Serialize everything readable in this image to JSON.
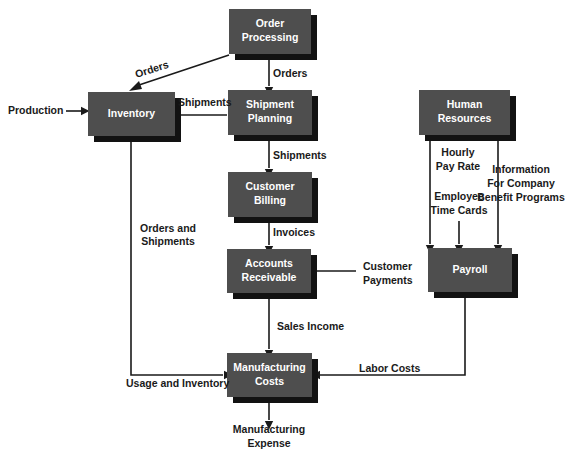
{
  "diagram": {
    "type": "flowchart",
    "background_color": "#ffffff",
    "node_fill_color": "#4e4e4e",
    "node_shadow_color": "#121212",
    "node_text_color": "#ffffff",
    "edge_color": "#1a1a1a",
    "nodes": [
      {
        "id": "order_processing",
        "line1": "Order",
        "line2": "Processing",
        "x": 229,
        "y": 9,
        "w": 82,
        "h": 45
      },
      {
        "id": "inventory",
        "line1": "Inventory",
        "line2": "",
        "x": 88,
        "y": 92,
        "w": 87,
        "h": 44
      },
      {
        "id": "shipment_planning",
        "line1": "Shipment",
        "line2": "Planning",
        "x": 228,
        "y": 90,
        "w": 84,
        "h": 45
      },
      {
        "id": "human_resources",
        "line1": "Human",
        "line2": "Resources",
        "x": 419,
        "y": 90,
        "w": 91,
        "h": 45
      },
      {
        "id": "customer_billing",
        "line1": "Customer",
        "line2": "Billing",
        "x": 228,
        "y": 172,
        "w": 84,
        "h": 45
      },
      {
        "id": "accounts_receivable",
        "line1": "Accounts",
        "line2": "Receivable",
        "x": 227,
        "y": 249,
        "w": 84,
        "h": 44
      },
      {
        "id": "payroll",
        "line1": "Payroll",
        "line2": "",
        "x": 428,
        "y": 248,
        "w": 84,
        "h": 44
      },
      {
        "id": "manufacturing_costs",
        "line1": "Manufacturing",
        "line2": "Costs",
        "x": 227,
        "y": 353,
        "w": 85,
        "h": 44
      }
    ],
    "edge_labels": [
      {
        "id": "orders_diagonal",
        "text": "Orders",
        "x": 152,
        "y": 70,
        "anchor": "mid",
        "rotate": -18
      },
      {
        "id": "orders_vertical",
        "text": "Orders",
        "x": 273,
        "y": 74,
        "anchor": "start"
      },
      {
        "id": "production",
        "text": "Production",
        "x": 8,
        "y": 111,
        "anchor": "start"
      },
      {
        "id": "shipments_to_inv",
        "text": "Shipments",
        "x": 178,
        "y": 103,
        "anchor": "start"
      },
      {
        "id": "shipments_down",
        "text": "Shipments",
        "x": 273,
        "y": 156,
        "anchor": "start"
      },
      {
        "id": "invoices",
        "text": "Invoices",
        "x": 273,
        "y": 233,
        "anchor": "start"
      },
      {
        "id": "orders_and_shipments_1",
        "text": "Orders and",
        "x": 168,
        "y": 229,
        "anchor": "mid"
      },
      {
        "id": "orders_and_shipments_2",
        "text": "Shipments",
        "x": 168,
        "y": 242,
        "anchor": "mid"
      },
      {
        "id": "customer_payments_1",
        "text": "Customer",
        "x": 363,
        "y": 267,
        "anchor": "start"
      },
      {
        "id": "customer_payments_2",
        "text": "Payments",
        "x": 363,
        "y": 281,
        "anchor": "start"
      },
      {
        "id": "hourly_pay_rate_1",
        "text": "Hourly",
        "x": 458,
        "y": 153,
        "anchor": "mid"
      },
      {
        "id": "hourly_pay_rate_2",
        "text": "Pay Rate",
        "x": 458,
        "y": 167,
        "anchor": "mid"
      },
      {
        "id": "employee_time_cards_1",
        "text": "Employee",
        "x": 459,
        "y": 197,
        "anchor": "mid"
      },
      {
        "id": "employee_time_cards_2",
        "text": "Time Cards",
        "x": 459,
        "y": 211,
        "anchor": "mid"
      },
      {
        "id": "info_benefit_1",
        "text": "Information",
        "x": 521,
        "y": 170,
        "anchor": "mid"
      },
      {
        "id": "info_benefit_2",
        "text": "For Company",
        "x": 521,
        "y": 184,
        "anchor": "mid"
      },
      {
        "id": "info_benefit_3",
        "text": "Benefit Programs",
        "x": 521,
        "y": 198,
        "anchor": "mid"
      },
      {
        "id": "sales_income",
        "text": "Sales Income",
        "x": 277,
        "y": 327,
        "anchor": "start"
      },
      {
        "id": "usage_and_inventory",
        "text": "Usage and Inventory",
        "x": 126,
        "y": 384,
        "anchor": "start"
      },
      {
        "id": "labor_costs",
        "text": "Labor Costs",
        "x": 359,
        "y": 369,
        "anchor": "start"
      },
      {
        "id": "manufacturing_expense_1",
        "text": "Manufacturing",
        "x": 269,
        "y": 430,
        "anchor": "mid"
      },
      {
        "id": "manufacturing_expense_2",
        "text": "Expense",
        "x": 269,
        "y": 444,
        "anchor": "mid"
      }
    ],
    "connectors": [
      {
        "id": "order-processing-to-inventory-diagonal",
        "d": "M 229 55 L 136 86"
      },
      {
        "id": "order-processing-to-shipment-planning",
        "d": "M 269 54 L 269 86"
      },
      {
        "id": "production-to-inventory",
        "d": "M 66 111 L 84 111"
      },
      {
        "id": "shipment-planning-to-inventory",
        "d": "M 227 115 L 180 115"
      },
      {
        "id": "shipment-planning-to-customer-billing",
        "d": "M 269 135 L 269 168"
      },
      {
        "id": "customer-billing-to-accounts-receivable",
        "d": "M 269 217 L 269 245"
      },
      {
        "id": "customer-payments-to-accounts-receivable",
        "d": "M 356 271 L 317 271"
      },
      {
        "id": "human-resources-to-payroll-left",
        "d": "M 430 135 L 430 244"
      },
      {
        "id": "employee-time-cards-to-payroll",
        "d": "M 459 221 L 459 244"
      },
      {
        "id": "human-resources-to-payroll-right",
        "d": "M 498 135 L 498 244"
      },
      {
        "id": "accounts-receivable-to-manufacturing",
        "d": "M 269 293 L 269 349"
      },
      {
        "id": "inventory-to-manufacturing",
        "d": "M 131 136 L 131 375 L 223 375"
      },
      {
        "id": "payroll-to-manufacturing",
        "d": "M 465 292 L 465 375 L 317 375"
      },
      {
        "id": "manufacturing-to-expense",
        "d": "M 269 397 L 269 420"
      }
    ],
    "arrowheads": [
      {
        "id": "arrow-into-inventory-diagonal",
        "x": 136,
        "y": 86,
        "dir": "diag-sw"
      },
      {
        "id": "arrow-into-shipment-planning",
        "x": 269,
        "y": 88,
        "dir": "down"
      },
      {
        "id": "arrow-into-inventory-left",
        "x": 82,
        "y": 111,
        "dir": "right"
      },
      {
        "id": "arrow-into-inventory-right",
        "x": 178,
        "y": 115,
        "dir": "left"
      },
      {
        "id": "arrow-into-customer-billing",
        "x": 269,
        "y": 170,
        "dir": "down"
      },
      {
        "id": "arrow-into-accounts-receivable",
        "x": 269,
        "y": 247,
        "dir": "down"
      },
      {
        "id": "arrow-customer-payments",
        "x": 315,
        "y": 271,
        "dir": "left"
      },
      {
        "id": "arrow-payroll-left",
        "x": 430,
        "y": 246,
        "dir": "down"
      },
      {
        "id": "arrow-payroll-mid",
        "x": 459,
        "y": 246,
        "dir": "down"
      },
      {
        "id": "arrow-payroll-right",
        "x": 498,
        "y": 246,
        "dir": "down"
      },
      {
        "id": "arrow-into-manufacturing-top",
        "x": 269,
        "y": 351,
        "dir": "down"
      },
      {
        "id": "arrow-into-manufacturing-left",
        "x": 225,
        "y": 375,
        "dir": "right"
      },
      {
        "id": "arrow-into-manufacturing-right",
        "x": 319,
        "y": 375,
        "dir": "left"
      },
      {
        "id": "arrow-manufacturing-expense",
        "x": 269,
        "y": 422,
        "dir": "down"
      }
    ]
  }
}
